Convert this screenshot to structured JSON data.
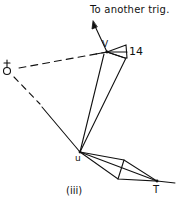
{
  "diagram": {
    "caption": "(iii)",
    "arrow_label": "To another trig.",
    "stations": {
      "V": "V",
      "u": "u",
      "T": "T",
      "mark14": "14"
    },
    "colors": {
      "ink": "#111111",
      "background": "#ffffff"
    }
  }
}
